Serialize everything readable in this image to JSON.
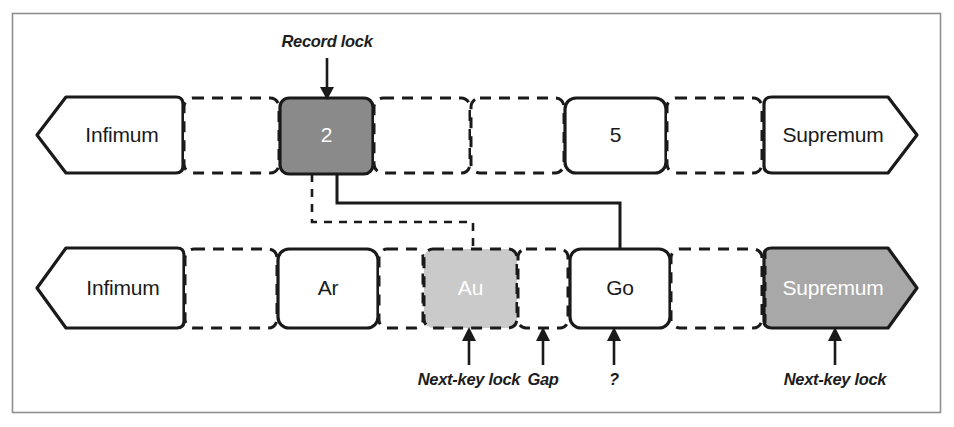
{
  "figure": {
    "frame": {
      "border_color": "#8c8c8c",
      "background": "#ffffff"
    },
    "colors": {
      "record_lock_fill": "#8a8a8a",
      "next_key_lock_fill": "#c9c9c9",
      "supremum_lock_fill": "#a8a8a8",
      "stroke": "#1a1a1a",
      "text_dark": "#1a1a1a",
      "text_light": "#ffffff"
    },
    "rows": [
      {
        "name": "primary-key-index-row",
        "cells": [
          {
            "id": "top-infimum",
            "label": "Infimum",
            "shape": "pentagon-left",
            "border": "solid",
            "fill": "white",
            "text": "dark"
          },
          {
            "id": "top-gap-1",
            "label": "",
            "shape": "rect",
            "border": "dashed",
            "fill": "white",
            "text": "dark"
          },
          {
            "id": "top-record-2",
            "label": "2",
            "shape": "rect",
            "border": "solid",
            "fill": "record_lock",
            "text": "light"
          },
          {
            "id": "top-gap-2",
            "label": "",
            "shape": "rect",
            "border": "dashed",
            "fill": "white",
            "text": "dark"
          },
          {
            "id": "top-gap-3",
            "label": "",
            "shape": "rect",
            "border": "dashed",
            "fill": "white",
            "text": "dark"
          },
          {
            "id": "top-record-5",
            "label": "5",
            "shape": "rect",
            "border": "solid",
            "fill": "white",
            "text": "dark"
          },
          {
            "id": "top-gap-4",
            "label": "",
            "shape": "rect",
            "border": "dashed",
            "fill": "white",
            "text": "dark"
          },
          {
            "id": "top-supremum",
            "label": "Supremum",
            "shape": "pentagon-right",
            "border": "solid",
            "fill": "white",
            "text": "dark"
          }
        ]
      },
      {
        "name": "secondary-index-row",
        "cells": [
          {
            "id": "bot-infimum",
            "label": "Infimum",
            "shape": "pentagon-left",
            "border": "solid",
            "fill": "white",
            "text": "dark"
          },
          {
            "id": "bot-gap-1",
            "label": "",
            "shape": "rect",
            "border": "dashed",
            "fill": "white",
            "text": "dark"
          },
          {
            "id": "bot-record-ar",
            "label": "Ar",
            "shape": "rect",
            "border": "solid",
            "fill": "white",
            "text": "dark"
          },
          {
            "id": "bot-gap-2",
            "label": "",
            "shape": "rect",
            "border": "dashed",
            "fill": "white",
            "text": "dark"
          },
          {
            "id": "bot-record-au",
            "label": "Au",
            "shape": "rect",
            "border": "dashed",
            "fill": "next_key_lock",
            "text": "light"
          },
          {
            "id": "bot-gap-3",
            "label": "",
            "shape": "rect",
            "border": "dashed",
            "fill": "white",
            "text": "dark"
          },
          {
            "id": "bot-record-go",
            "label": "Go",
            "shape": "rect",
            "border": "solid",
            "fill": "white",
            "text": "dark"
          },
          {
            "id": "bot-gap-4",
            "label": "",
            "shape": "rect",
            "border": "dashed",
            "fill": "white",
            "text": "dark"
          },
          {
            "id": "bot-supremum",
            "label": "Supremum",
            "shape": "pentagon-right",
            "border": "dashed",
            "fill": "supremum_lock",
            "text": "light"
          }
        ]
      }
    ],
    "annotations": [
      {
        "id": "annot-record-lock",
        "text": "Record lock",
        "points_to": "top-record-2",
        "direction": "down"
      },
      {
        "id": "annot-next-key-lock-au",
        "text": "Next-key lock",
        "points_to": "bot-record-au",
        "direction": "up"
      },
      {
        "id": "annot-gap",
        "text": "Gap",
        "points_to": "bot-gap-3",
        "direction": "up"
      },
      {
        "id": "annot-question",
        "text": "?",
        "points_to": "bot-record-go",
        "direction": "up"
      },
      {
        "id": "annot-next-key-lock-supremum",
        "text": "Next-key lock",
        "points_to": "bot-supremum",
        "direction": "up"
      }
    ],
    "connectors": [
      {
        "id": "connector-2-to-au",
        "from": "top-record-2",
        "to": "bot-record-au",
        "style": "dashed"
      },
      {
        "id": "connector-2-to-go",
        "from": "top-record-2",
        "to": "bot-record-go",
        "style": "solid"
      }
    ]
  }
}
